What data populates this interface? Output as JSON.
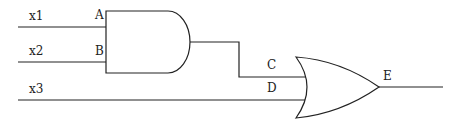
{
  "diagram": {
    "type": "logic-circuit",
    "inputs": [
      {
        "name": "x1",
        "label": "x1"
      },
      {
        "name": "x2",
        "label": "x2"
      },
      {
        "name": "x3",
        "label": "x3"
      }
    ],
    "gates": [
      {
        "id": "and1",
        "type": "AND",
        "inputs": [
          "A",
          "B"
        ],
        "output": "C"
      },
      {
        "id": "or1",
        "type": "OR",
        "inputs": [
          "C",
          "D"
        ],
        "output": "E"
      }
    ],
    "node_labels": {
      "A": "A",
      "B": "B",
      "C": "C",
      "D": "D",
      "E": "E"
    },
    "connections": [
      {
        "from": "x1",
        "to": "A"
      },
      {
        "from": "x2",
        "to": "B"
      },
      {
        "from": "and1.out",
        "to": "C"
      },
      {
        "from": "x3",
        "to": "D"
      },
      {
        "from": "or1.out",
        "to": "E"
      }
    ],
    "colors": {
      "line": "#222222",
      "background": "#ffffff"
    }
  }
}
